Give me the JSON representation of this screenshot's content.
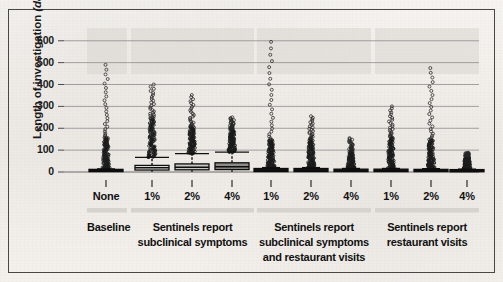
{
  "figure": {
    "background_hex": "#f2f0ec",
    "ink_hex": "#111111",
    "border_hex": "#4a4643"
  },
  "chart_data": {
    "type": "box",
    "title": "",
    "xlabel": "",
    "ylabel": "Length of investigation (days)",
    "ylabel_plain": "Length of investigation",
    "ylabel_italic": "days",
    "ylim": [
      0,
      640
    ],
    "yticks": [
      0,
      100,
      200,
      300,
      400,
      500,
      600
    ],
    "ytick_labels": [
      "0",
      "100",
      "200",
      "300",
      "400",
      "500",
      "600"
    ],
    "grid": "horizontal",
    "legend": "none",
    "categories": [
      "None",
      "1%",
      "2%",
      "4%",
      "1%",
      "2%",
      "4%",
      "1%",
      "2%",
      "4%"
    ],
    "groups": [
      {
        "label": "Baseline",
        "categories": [
          "None"
        ]
      },
      {
        "label": "Sentinels report subclinical symptoms",
        "label_lines": [
          "Sentinels report",
          "subclinical symptoms"
        ],
        "categories": [
          "1%",
          "2%",
          "4%"
        ]
      },
      {
        "label": "Sentinels report subclinical symptoms and restaurant visits",
        "label_lines": [
          "Sentinels report",
          "subclinical symptoms",
          "and restaurant visits"
        ],
        "categories": [
          "1%",
          "2%",
          "4%"
        ]
      },
      {
        "label": "Sentinels report restaurant visits",
        "label_lines": [
          "Sentinels report",
          "restaurant visits"
        ],
        "categories": [
          "1%",
          "2%",
          "4%"
        ]
      }
    ],
    "boxes": [
      {
        "category": "None",
        "group": "Baseline",
        "q1": 2,
        "median": 5,
        "q3": 12,
        "whisker_low": 0,
        "whisker_high": 14,
        "fill": "#141414",
        "outlier_max": 490,
        "outlier_dense_top": 160
      },
      {
        "category": "1%",
        "group": "Sentinels report subclinical symptoms",
        "q1": 9,
        "median": 20,
        "q3": 30,
        "whisker_low": 0,
        "whisker_high": 67,
        "fill": "#f2f1ee",
        "outlier_max": 400,
        "outlier_dense_top": 250
      },
      {
        "category": "2%",
        "group": "Sentinels report subclinical symptoms",
        "q1": 10,
        "median": 22,
        "q3": 37,
        "whisker_low": 0,
        "whisker_high": 84,
        "fill": "#c9c7c3",
        "outlier_max": 352,
        "outlier_dense_top": 210
      },
      {
        "category": "4%",
        "group": "Sentinels report subclinical symptoms",
        "q1": 11,
        "median": 24,
        "q3": 42,
        "whisker_low": 0,
        "whisker_high": 91,
        "fill": "#8e8c89",
        "outlier_max": 250,
        "outlier_dense_top": 200
      },
      {
        "category": "1%",
        "group": "Sentinels report subclinical symptoms and restaurant visits",
        "q1": 2,
        "median": 6,
        "q3": 16,
        "whisker_low": 0,
        "whisker_high": 20,
        "fill": "#141414",
        "outlier_max": 595,
        "outlier_dense_top": 150
      },
      {
        "category": "2%",
        "group": "Sentinels report subclinical symptoms and restaurant visits",
        "q1": 2,
        "median": 6,
        "q3": 16,
        "whisker_low": 0,
        "whisker_high": 20,
        "fill": "#141414",
        "outlier_max": 255,
        "outlier_dense_top": 150
      },
      {
        "category": "4%",
        "group": "Sentinels report subclinical symptoms and restaurant visits",
        "q1": 2,
        "median": 5,
        "q3": 13,
        "whisker_low": 0,
        "whisker_high": 16,
        "fill": "#141414",
        "outlier_max": 155,
        "outlier_dense_top": 100
      },
      {
        "category": "1%",
        "group": "Sentinels report restaurant visits",
        "q1": 2,
        "median": 5,
        "q3": 13,
        "whisker_low": 0,
        "whisker_high": 16,
        "fill": "#141414",
        "outlier_max": 300,
        "outlier_dense_top": 160
      },
      {
        "category": "2%",
        "group": "Sentinels report restaurant visits",
        "q1": 2,
        "median": 5,
        "q3": 12,
        "whisker_low": 0,
        "whisker_high": 15,
        "fill": "#141414",
        "outlier_max": 475,
        "outlier_dense_top": 150
      },
      {
        "category": "4%",
        "group": "Sentinels report restaurant visits",
        "q1": 1,
        "median": 4,
        "q3": 11,
        "whisker_low": 0,
        "whisker_high": 13,
        "fill": "#141414",
        "outlier_max": 88,
        "outlier_dense_top": 75
      }
    ]
  }
}
